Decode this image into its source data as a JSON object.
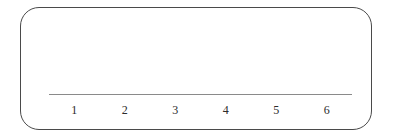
{
  "figure": {
    "width": 393,
    "height": 138,
    "background_color": "#ffffff",
    "frame": {
      "name": "rounded-panel-border",
      "stroke_color": "#4a4a4a",
      "corner_radius_px": 19,
      "stroke_width_px": 1.4
    },
    "axis": {
      "line_color": "#8a8a8a",
      "label_color": "#2b2b2b"
    }
  },
  "chart_data": {
    "type": "bar",
    "title": "",
    "subtitle": "",
    "xlabel": "",
    "ylabel": "",
    "categories": [
      "1",
      "2",
      "3",
      "4",
      "5",
      "6"
    ],
    "values": [
      0,
      0,
      0,
      0,
      0,
      0
    ],
    "series": [],
    "annotations": [],
    "legend": {
      "entries": [],
      "position": "none",
      "visible": false
    },
    "grid": {
      "x": false,
      "y": false
    },
    "axes": {
      "x": {
        "visible": true,
        "tick_labels": [
          "1",
          "2",
          "3",
          "4",
          "5",
          "6"
        ],
        "tick_count": 6,
        "line_visible": true
      },
      "y": {
        "visible": false,
        "tick_labels": [],
        "line_visible": false
      }
    }
  }
}
